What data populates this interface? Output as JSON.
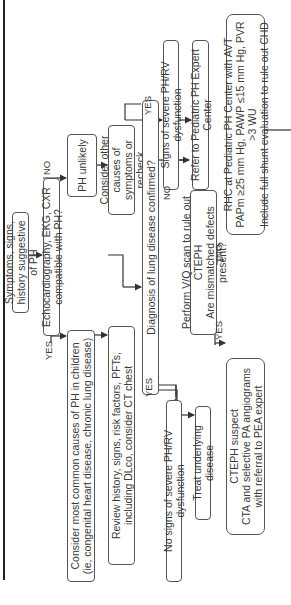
{
  "flowchart": {
    "nodes": {
      "symptoms": "Symptoms, signs, history suggestive of PH",
      "echo": "Echocardiography, EKG, CXR compatible with PH?",
      "ph_unlikely": "PH unlikely",
      "common_causes": "Consider most common causes of PH in children\n(ie, congenital heart disease, chronic lung disease)",
      "other_causes": "Consider other causes of\nsymptoms or recheck",
      "review_history": "Review history, signs, risk factors, PFTs,\nincluding DLco, consider CT chest",
      "lung_disease": "Diagnosis of lung disease confirmed?",
      "signs_severe": "Signs of severe PH/RV dysfunction",
      "refer": "Refer to Pediatric PH Expert Center",
      "no_signs_severe": "No signs of severe PH/RV dysfunction",
      "treat_underlying": "Treat underlying disease",
      "vq_scan": "Perform V/Q scan to rule out CTEPH\nAre mismatched defects present?",
      "rhc": "RHC at Pediatric PH Center with AVT\nPAPm ≥25 mm Hg, PAWP ≤15 mm Hg, PVR >3 WU\nInclude full shunt evaluation to rule out CHD",
      "cteph_suspect": "CTEPH suspect\nCTA and selective PA angiograms\nwith referral to PEA expert"
    },
    "edge_labels": {
      "echo_yes": "YES",
      "echo_no": "NO",
      "lung_yes_left": "YES",
      "lung_yes_right": "YES",
      "lung_no": "NO",
      "vq_yes": "YES",
      "vq_no": "NO"
    }
  }
}
